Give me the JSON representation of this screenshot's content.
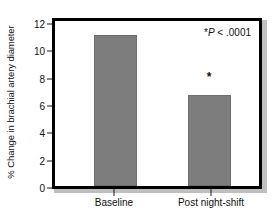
{
  "chart_data": {
    "type": "bar",
    "title": "",
    "xlabel": "",
    "ylabel": "% Change in brachial artery diameter",
    "categories": [
      "Baseline",
      "Post night-shift"
    ],
    "values": [
      11.0,
      6.6
    ],
    "ylim": [
      0,
      12
    ],
    "yticks": [
      0,
      2,
      4,
      6,
      8,
      10,
      12
    ],
    "ytick_labels": [
      "0",
      "2",
      "4",
      "6",
      "8",
      "10",
      "12"
    ],
    "grid": false,
    "legend": "none",
    "bar_color": "#7d7d7d",
    "frame_color": "#000000",
    "annotations": [
      {
        "name": "significance-note",
        "star": "*",
        "p_symbol": "P",
        "text": " < .0001",
        "full_text": "*P < .0001"
      },
      {
        "name": "bar-significance-marker",
        "symbol": "*",
        "applies_to": "Post night-shift"
      }
    ]
  }
}
